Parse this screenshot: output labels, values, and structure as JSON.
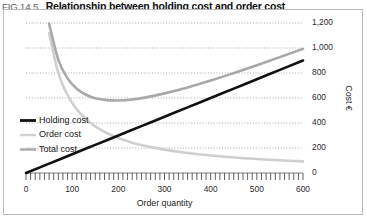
{
  "figure": {
    "number": "FIG 14.5",
    "title": "Relationship between holding cost and order cost"
  },
  "chart_data": {
    "type": "line",
    "title": "Relationship between holding cost and order cost",
    "xlabel": "Order quantity",
    "ylabel": "Cost €",
    "xlim": [
      0,
      600
    ],
    "ylim": [
      0,
      1200
    ],
    "xticks": [
      0,
      100,
      200,
      300,
      400,
      500,
      600
    ],
    "xtick_labels": [
      "0",
      "100",
      "200",
      "300",
      "400",
      "500",
      "600"
    ],
    "yticks": [
      0,
      200,
      400,
      600,
      800,
      1000,
      1200
    ],
    "ytick_labels": [
      "0",
      "200",
      "400",
      "600",
      "800",
      "1,000",
      "1,200"
    ],
    "x_minor_tick_step": 10,
    "grid": "horizontal-dotted",
    "legend_position": "inner-left-lower",
    "series": [
      {
        "name": "Holding cost",
        "color": "#111111",
        "width": 2.6,
        "x": [
          0,
          50,
          100,
          150,
          200,
          250,
          300,
          350,
          400,
          450,
          500,
          550,
          600
        ],
        "values": [
          0,
          75,
          150,
          225,
          300,
          375,
          450,
          525,
          600,
          675,
          750,
          825,
          900
        ]
      },
      {
        "name": "Order cost",
        "color": "#cfcfcf",
        "width": 2.6,
        "x": [
          50,
          70,
          90,
          110,
          130,
          150,
          175,
          200,
          230,
          260,
          300,
          350,
          400,
          450,
          500,
          550,
          600
        ],
        "values": [
          1120,
          800,
          622,
          509,
          431,
          373,
          320,
          280,
          243,
          215,
          187,
          160,
          140,
          124,
          112,
          102,
          93
        ]
      },
      {
        "name": "Total cost",
        "color": "#a8a8a8",
        "width": 2.6,
        "x": [
          50,
          70,
          90,
          110,
          130,
          150,
          175,
          200,
          230,
          260,
          300,
          350,
          400,
          450,
          500,
          550,
          600
        ],
        "values": [
          1195,
          905,
          757,
          674,
          626,
          598,
          583,
          580,
          588,
          605,
          637,
          685,
          740,
          799,
          862,
          927,
          993
        ]
      }
    ],
    "annotations": []
  },
  "legend": {
    "items": [
      {
        "label": "Holding cost",
        "color": "#111111",
        "width": 2.8
      },
      {
        "label": "Order cost",
        "color": "#cfcfcf",
        "width": 2.4
      },
      {
        "label": "Total cost",
        "color": "#a8a8a8",
        "width": 2.4
      }
    ]
  }
}
